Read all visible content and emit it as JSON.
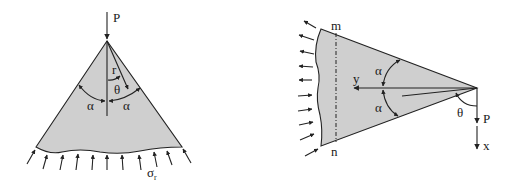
{
  "figures": [
    {
      "id": "wedge-vertical",
      "labels": {
        "load": "P",
        "radius": "r",
        "angle": "θ",
        "half_angle_left": "α",
        "half_angle_right": "α",
        "stress": "σ",
        "stress_subscript": "r"
      }
    },
    {
      "id": "wedge-horizontal",
      "labels": {
        "top_point": "m",
        "bottom_point": "n",
        "y_axis": "y",
        "x_axis": "x",
        "half_angle_top": "α",
        "half_angle_bottom": "α",
        "angle": "θ",
        "load": "P"
      }
    }
  ],
  "colors": {
    "wedge_fill": "#cfcfcf",
    "line": "#222222",
    "background": "#ffffff"
  }
}
